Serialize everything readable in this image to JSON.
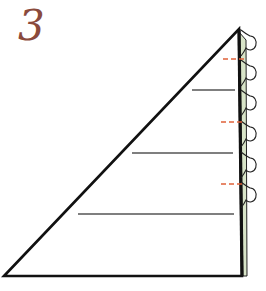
{
  "step": {
    "number": "3"
  },
  "colors": {
    "outline": "#111111",
    "guide_line": "#555555",
    "fold_mark": "#e0623a",
    "edge_strip": "#d8e4c8",
    "step_number": "#8a4a3c"
  },
  "diagram": {
    "type": "folding-instruction",
    "triangle": {
      "points": [
        [
          4,
          276
        ],
        [
          239,
          29
        ],
        [
          242,
          276
        ]
      ]
    },
    "guide_lines": [
      {
        "y": 90,
        "x1": 192,
        "x2": 235
      },
      {
        "y": 153,
        "x1": 132,
        "x2": 233
      },
      {
        "y": 214,
        "x1": 78,
        "x2": 234
      }
    ],
    "fold_marks": [
      {
        "y": 59,
        "x1": 223,
        "x2": 244
      },
      {
        "y": 122,
        "x1": 221,
        "x2": 244
      },
      {
        "y": 184,
        "x1": 221,
        "x2": 244
      }
    ],
    "loops": [
      43,
      73,
      103,
      134,
      165,
      195
    ]
  }
}
